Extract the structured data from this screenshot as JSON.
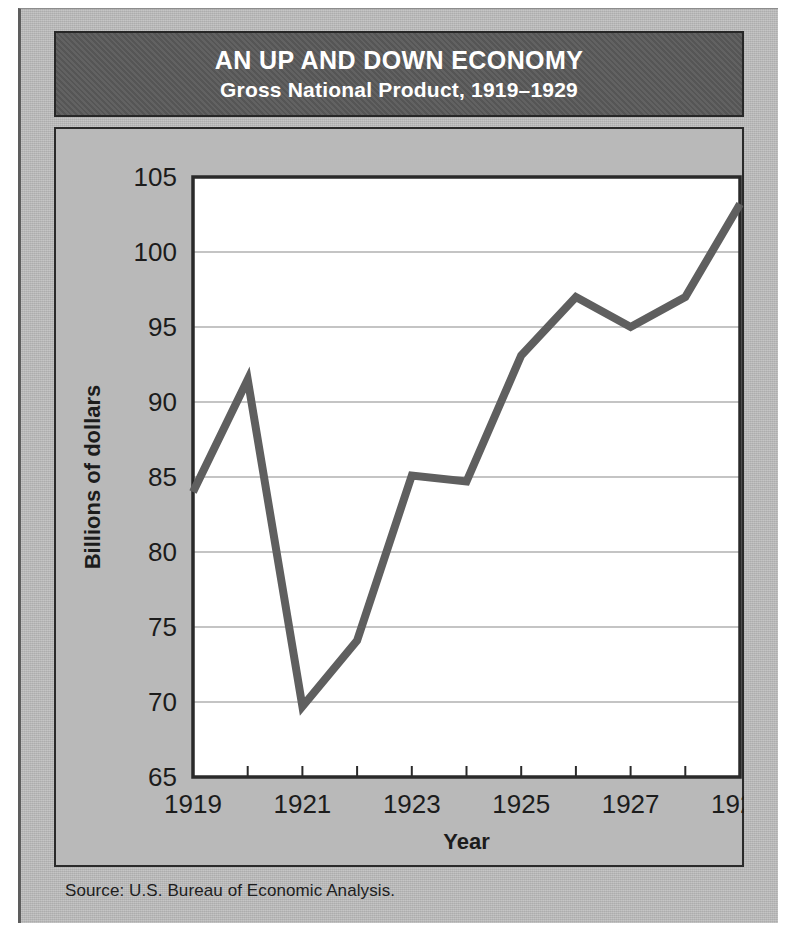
{
  "figure": {
    "title_main": "AN UP AND DOWN ECONOMY",
    "title_sub": "Gross National Product, 1919–1929",
    "source": "Source: U.S. Bureau of Economic Analysis."
  },
  "colors": {
    "page_background": "#b9b9b9",
    "banner_background": "#5a5a5a",
    "banner_text": "#ffffff",
    "plot_background": "#ffffff",
    "line": "#5f5f5f",
    "gridline": "#b0b0b0",
    "frame": "#2a2a2a",
    "axis_text": "#1c1c1c"
  },
  "chart_data": {
    "type": "line",
    "title": "AN UP AND DOWN ECONOMY",
    "subtitle": "Gross National Product, 1919–1929",
    "xlabel": "Year",
    "ylabel": "Billions of dollars",
    "x": [
      1919,
      1920,
      1921,
      1922,
      1923,
      1924,
      1925,
      1926,
      1927,
      1928,
      1929
    ],
    "values": [
      84.0,
      91.5,
      69.7,
      74.1,
      85.1,
      84.7,
      93.1,
      97.0,
      95.0,
      97.0,
      103.2
    ],
    "xlim": [
      1919,
      1929
    ],
    "ylim": [
      65,
      105
    ],
    "xticks": [
      1919,
      1920,
      1921,
      1922,
      1923,
      1924,
      1925,
      1926,
      1927,
      1928,
      1929
    ],
    "xticklabels": [
      "1919",
      "",
      "1921",
      "",
      "1923",
      "",
      "1925",
      "",
      "1927",
      "",
      "1929"
    ],
    "xtick_labels_shown": [
      "1919",
      "1921",
      "1923",
      "1925",
      "1927",
      "1929"
    ],
    "yticks": [
      65,
      70,
      75,
      80,
      85,
      90,
      95,
      100,
      105
    ],
    "yticklabels": [
      "65",
      "70",
      "75",
      "80",
      "85",
      "90",
      "95",
      "100",
      "105"
    ],
    "grid": "horizontal",
    "legend": "none",
    "series": [
      {
        "name": "Gross National Product",
        "values": [
          84.0,
          91.5,
          69.7,
          74.1,
          85.1,
          84.7,
          93.1,
          97.0,
          95.0,
          97.0,
          103.2
        ]
      }
    ],
    "source": "Source: U.S. Bureau of Economic Analysis."
  }
}
